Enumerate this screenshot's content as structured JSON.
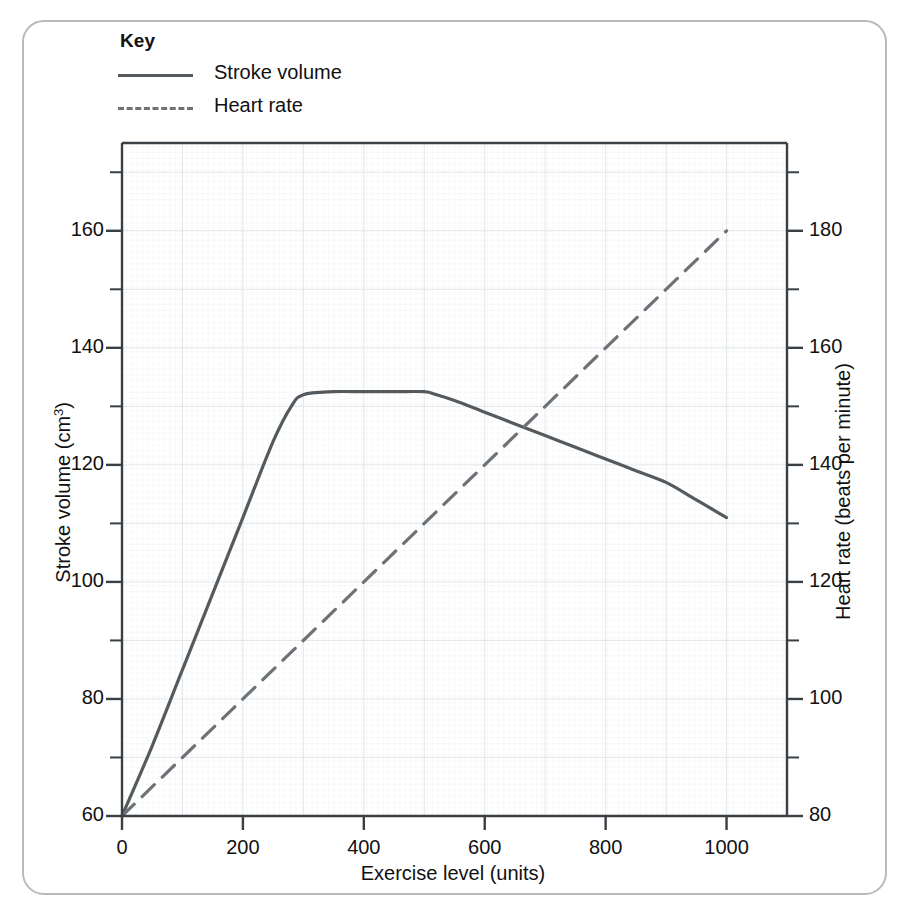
{
  "key": {
    "title": "Key",
    "entries": [
      {
        "label": "Stroke volume",
        "style": "solid",
        "color": "#555a5e"
      },
      {
        "label": "Heart rate",
        "style": "dashed",
        "color": "#6e7276"
      }
    ]
  },
  "chart_data": {
    "type": "line",
    "title": "",
    "xlabel": "Exercise level (units)",
    "ylabel": "Stroke volume (cm3)",
    "y2label": "Heart rate (beats per minute)",
    "xlim": [
      0,
      1100
    ],
    "ylim": [
      60,
      175
    ],
    "y2lim": [
      80,
      195
    ],
    "xticks": [
      0,
      200,
      400,
      600,
      800,
      1000
    ],
    "yticks": [
      60,
      80,
      100,
      120,
      140,
      160
    ],
    "y2ticks": [
      80,
      100,
      120,
      140,
      160,
      180
    ],
    "yminor_step": 10,
    "y2minor_step": 10,
    "grid": true,
    "legend": "top-left-outside",
    "series": [
      {
        "name": "Stroke volume",
        "axis": "left",
        "style": "solid",
        "color": "#555a5e",
        "x": [
          0,
          50,
          100,
          150,
          200,
          250,
          280,
          300,
          350,
          400,
          450,
          500,
          520,
          550,
          600,
          650,
          700,
          750,
          800,
          850,
          900,
          950,
          1000
        ],
        "y": [
          60,
          72,
          85,
          98,
          111,
          124,
          130,
          132,
          132.5,
          132.5,
          132.5,
          132.5,
          132,
          131,
          129,
          127,
          125,
          123,
          121,
          119,
          117,
          114,
          111
        ]
      },
      {
        "name": "Heart rate",
        "axis": "right",
        "style": "dashed",
        "color": "#6e7276",
        "x": [
          0,
          200,
          400,
          600,
          800,
          1000
        ],
        "y": [
          80,
          100,
          120,
          140,
          160,
          180
        ]
      }
    ]
  }
}
